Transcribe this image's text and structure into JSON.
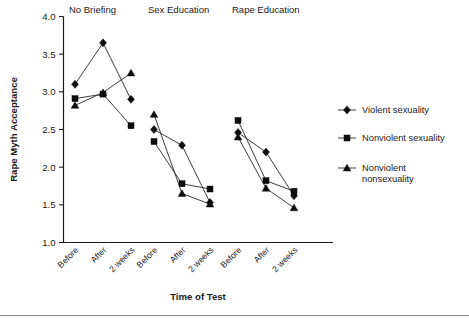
{
  "chart_data": {
    "type": "line",
    "title": "",
    "xlabel": "Time of Test",
    "ylabel": "Rape Myth Acceptance",
    "ylim": [
      1.0,
      4.0
    ],
    "yticks": [
      "1.0",
      "1.5",
      "2.0",
      "2.5",
      "3.0",
      "3.5",
      "4.0"
    ],
    "ytick_values": [
      1.0,
      1.5,
      2.0,
      2.5,
      3.0,
      3.5,
      4.0
    ],
    "grid": false,
    "legend_position": "right",
    "categories": [
      "Before",
      "After",
      "2 weeks"
    ],
    "panels": [
      {
        "label": "No Briefing",
        "series": [
          {
            "name": "Violent sexuality",
            "marker": "diamond",
            "values": [
              3.1,
              3.65,
              2.9
            ]
          },
          {
            "name": "Nonviolent sexuality",
            "marker": "square",
            "values": [
              2.91,
              2.97,
              2.55
            ]
          },
          {
            "name": "Nonviolent nonsexuality",
            "marker": "triangle",
            "values": [
              2.82,
              2.99,
              3.25
            ]
          }
        ]
      },
      {
        "label": "Sex Education",
        "series": [
          {
            "name": "Violent sexuality",
            "marker": "diamond",
            "values": [
              2.5,
              2.29,
              1.53
            ]
          },
          {
            "name": "Nonviolent sexuality",
            "marker": "square",
            "values": [
              2.34,
              1.78,
              1.71
            ]
          },
          {
            "name": "Nonviolent nonsexuality",
            "marker": "triangle",
            "values": [
              2.7,
              1.65,
              1.51
            ]
          }
        ]
      },
      {
        "label": "Rape Education",
        "series": [
          {
            "name": "Violent sexuality",
            "marker": "diamond",
            "values": [
              2.46,
              2.2,
              1.62
            ]
          },
          {
            "name": "Nonviolent sexuality",
            "marker": "square",
            "values": [
              2.62,
              1.82,
              1.68
            ]
          },
          {
            "name": "Nonviolent nonsexuality",
            "marker": "triangle",
            "values": [
              2.4,
              1.72,
              1.46
            ]
          }
        ]
      }
    ],
    "legend": [
      {
        "label": "Violent sexuality",
        "marker": "diamond"
      },
      {
        "label": "Nonviolent sexuality",
        "marker": "square"
      },
      {
        "label": "Nonviolent nonsexuality",
        "marker": "triangle",
        "label_line1": "Nonviolent",
        "label_line2": "nonsexuality"
      }
    ]
  },
  "axis": {
    "y_title": "Rape Myth Acceptance",
    "x_title": "Time of Test"
  },
  "colors": {
    "marker": "#0d0d0d",
    "line": "#1a1a1a",
    "axis": "#1a1a1a",
    "rule": "#8a8a8a",
    "background": "#ffffff"
  }
}
